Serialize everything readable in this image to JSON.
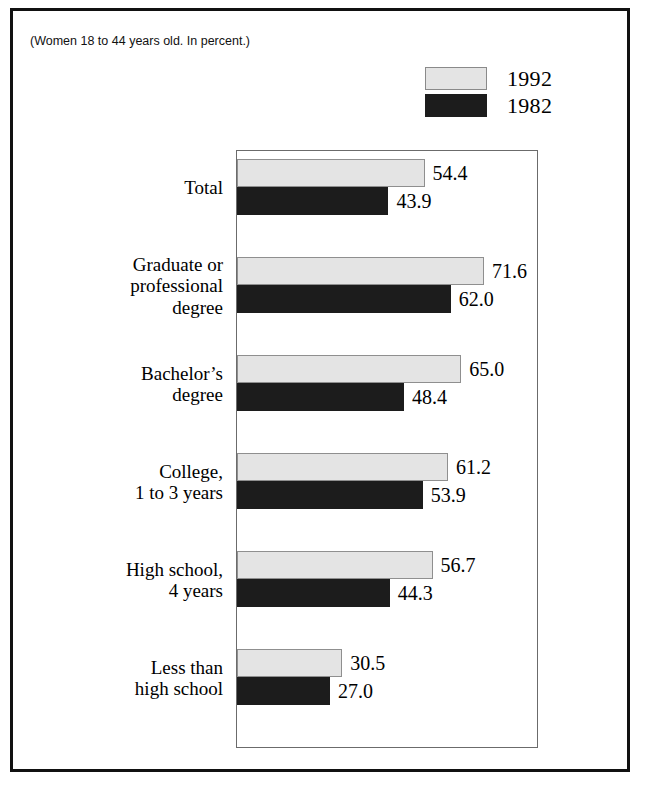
{
  "figure": {
    "subtitle": "(Women 18 to 44 years old. In percent.)"
  },
  "legend": {
    "items": [
      {
        "label": "1992",
        "swatch": "light-gray-swatch",
        "color": "#e4e4e4"
      },
      {
        "label": "1982",
        "swatch": "black-swatch",
        "color": "#1c1c1c"
      }
    ]
  },
  "chart_data": {
    "type": "bar",
    "orientation": "horizontal",
    "title": "",
    "subtitle": "(Women 18 to 44 years old. In percent.)",
    "xlabel": "",
    "ylabel": "",
    "xlim": [
      0,
      87
    ],
    "grid": false,
    "legend_position": "top-right",
    "categories": [
      "Total",
      "Graduate or\nprofessional\ndegree",
      "Bachelor’s\ndegree",
      "College,\n1 to 3 years",
      "High school,\n4 years",
      "Less than\nhigh school"
    ],
    "series": [
      {
        "name": "1992",
        "color": "#e4e4e4",
        "values": [
          54.4,
          71.6,
          65.0,
          61.2,
          56.7,
          30.5
        ]
      },
      {
        "name": "1982",
        "color": "#1c1c1c",
        "values": [
          43.9,
          62.0,
          48.4,
          53.9,
          44.3,
          27.0
        ]
      }
    ],
    "value_labels": [
      {
        "category": "Total",
        "1992": "54.4",
        "1982": "43.9"
      },
      {
        "category": "Graduate or professional degree",
        "1992": "71.6",
        "1982": "62.0"
      },
      {
        "category": "Bachelor’s degree",
        "1992": "65.0",
        "1982": "48.4"
      },
      {
        "category": "College, 1 to 3 years",
        "1992": "61.2",
        "1982": "53.9"
      },
      {
        "category": "High school, 4 years",
        "1992": "56.7",
        "1982": "44.3"
      },
      {
        "category": "Less than high school",
        "1992": "30.5",
        "1982": "27.0"
      }
    ]
  }
}
